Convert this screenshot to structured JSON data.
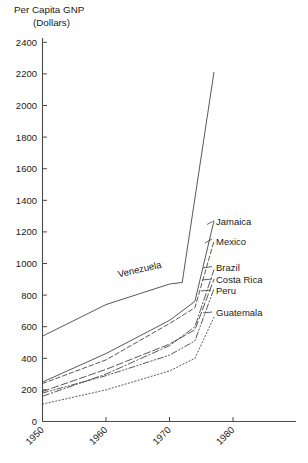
{
  "chart_data": {
    "type": "line",
    "title": "Per Capita GNP",
    "subtitle": "(Dollars)",
    "xlabel": "",
    "ylabel": "Per Capita GNP (Dollars)",
    "xlim": [
      1950,
      1984
    ],
    "ylim": [
      0,
      2400
    ],
    "ytick_labels": [
      "0",
      "200",
      "400",
      "600",
      "800",
      "1000",
      "1200",
      "1400",
      "1600",
      "1800",
      "2000",
      "2200",
      "2400"
    ],
    "ytick_values": [
      0,
      200,
      400,
      600,
      800,
      1000,
      1200,
      1400,
      1600,
      1800,
      2000,
      2200,
      2400
    ],
    "xtick_labels": [
      "1950",
      "1960",
      "1970",
      "1980"
    ],
    "xtick_values": [
      1950,
      1960,
      1970,
      1980
    ],
    "grid": false,
    "legend": "inline-right-labels",
    "series": [
      {
        "name": "Venezuela",
        "label": "Venezuela",
        "style": "solid",
        "x": [
          1950,
          1960,
          1970,
          1972,
          1977
        ],
        "values": [
          540,
          740,
          870,
          880,
          2210
        ]
      },
      {
        "name": "Jamaica",
        "label": "Jamaica",
        "style": "solid",
        "x": [
          1950,
          1960,
          1970,
          1974,
          1977
        ],
        "values": [
          250,
          430,
          640,
          760,
          1270
        ]
      },
      {
        "name": "Mexico",
        "label": "Mexico",
        "style": "dashed",
        "x": [
          1950,
          1960,
          1970,
          1974,
          1977
        ],
        "values": [
          240,
          390,
          620,
          720,
          1140
        ]
      },
      {
        "name": "Brazil",
        "label": "Brazil",
        "style": "dash-dot",
        "x": [
          1950,
          1960,
          1970,
          1974,
          1977
        ],
        "values": [
          160,
          300,
          480,
          600,
          960
        ]
      },
      {
        "name": "Costa Rica",
        "label": "Costa Rica",
        "style": "long-dash",
        "x": [
          1950,
          1960,
          1970,
          1974,
          1977
        ],
        "values": [
          190,
          330,
          490,
          580,
          900
        ]
      },
      {
        "name": "Peru",
        "label": "Peru",
        "style": "dash-dot-dot",
        "x": [
          1950,
          1960,
          1970,
          1974,
          1977
        ],
        "values": [
          180,
          290,
          420,
          510,
          840
        ]
      },
      {
        "name": "Guatemala",
        "label": "Guatemala",
        "style": "dotted",
        "x": [
          1950,
          1960,
          1970,
          1974,
          1977
        ],
        "values": [
          110,
          200,
          320,
          400,
          660
        ]
      }
    ],
    "annotations": [
      {
        "text": "Venezuela",
        "x": 1962,
        "y": 880,
        "rotation": -13
      }
    ]
  }
}
